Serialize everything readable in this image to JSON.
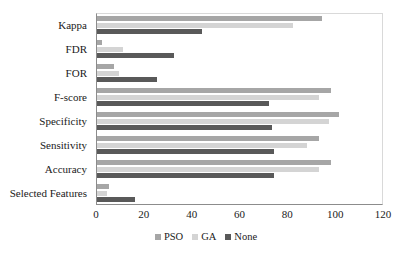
{
  "chart_data": {
    "type": "bar",
    "orientation": "horizontal",
    "title": "",
    "xlabel": "",
    "ylabel": "",
    "xlim": [
      0,
      120
    ],
    "xticks": [
      0,
      20,
      40,
      60,
      80,
      100,
      120
    ],
    "grid": false,
    "legend_position": "bottom",
    "categories": [
      "Kappa",
      "FDR",
      "FOR",
      "F-score",
      "Specificity",
      "Sensitivity",
      "Accuracy",
      "Selected Features"
    ],
    "series": [
      {
        "name": "PSO",
        "color": "#a6a6a6",
        "values": [
          94,
          2,
          7,
          98,
          101,
          93,
          98,
          5
        ]
      },
      {
        "name": "GA",
        "color": "#d4d4d4",
        "values": [
          82,
          11,
          9,
          93,
          97,
          88,
          93,
          4
        ]
      },
      {
        "name": "None",
        "color": "#595959",
        "values": [
          44,
          32,
          25,
          72,
          73,
          74,
          74,
          16
        ]
      }
    ]
  },
  "legend": {
    "items": [
      {
        "label": "PSO",
        "color": "#a6a6a6"
      },
      {
        "label": "GA",
        "color": "#d4d4d4"
      },
      {
        "label": "None",
        "color": "#595959"
      }
    ]
  }
}
